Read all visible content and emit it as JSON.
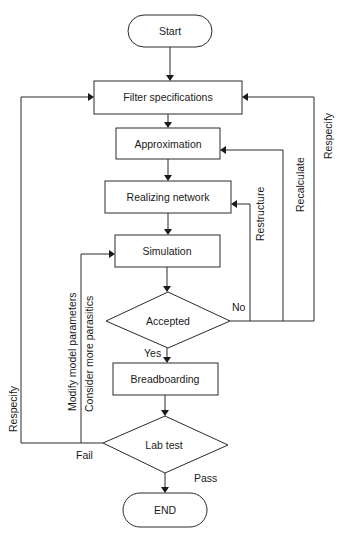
{
  "diagram": {
    "type": "flowchart",
    "nodes": {
      "start": {
        "label": "Start",
        "shape": "terminator"
      },
      "filter_specifications": {
        "label": "Filter specifications",
        "shape": "process"
      },
      "approximation": {
        "label": "Approximation",
        "shape": "process"
      },
      "realizing_network": {
        "label": "Realizing network",
        "shape": "process"
      },
      "simulation": {
        "label": "Simulation",
        "shape": "process"
      },
      "accepted": {
        "label": "Accepted",
        "shape": "decision"
      },
      "breadboarding": {
        "label": "Breadboarding",
        "shape": "process"
      },
      "lab_test": {
        "label": "Lab test",
        "shape": "decision"
      },
      "end": {
        "label": "END",
        "shape": "terminator"
      }
    },
    "edge_labels": {
      "accepted_no": "No",
      "accepted_yes": "Yes",
      "lab_fail": "Fail",
      "lab_pass": "Pass",
      "restructure": "Restructure",
      "recalculate": "Recalculate",
      "respecify_right": "Respecify",
      "respecify_left": "Respecify",
      "modify_model_parameters": "Modify model parameters",
      "consider_more_parasitics": "Consider more  parasitics"
    },
    "edges": [
      {
        "from": "Start",
        "to": "Filter specifications"
      },
      {
        "from": "Filter specifications",
        "to": "Approximation"
      },
      {
        "from": "Approximation",
        "to": "Realizing network"
      },
      {
        "from": "Realizing network",
        "to": "Simulation"
      },
      {
        "from": "Simulation",
        "to": "Accepted"
      },
      {
        "from": "Accepted",
        "to": "Breadboarding",
        "label": "Yes"
      },
      {
        "from": "Accepted",
        "to": "Realizing network",
        "label": "No / Restructure"
      },
      {
        "from": "Accepted",
        "to": "Approximation",
        "label": "No / Recalculate"
      },
      {
        "from": "Accepted",
        "to": "Filter specifications",
        "label": "No / Respecify"
      },
      {
        "from": "Breadboarding",
        "to": "Lab test"
      },
      {
        "from": "Lab test",
        "to": "END",
        "label": "Pass"
      },
      {
        "from": "Lab test",
        "to": "Simulation",
        "label": "Fail / Modify model parameters, Consider more parasitics"
      },
      {
        "from": "Lab test",
        "to": "Filter specifications",
        "label": "Fail / Respecify"
      }
    ]
  }
}
